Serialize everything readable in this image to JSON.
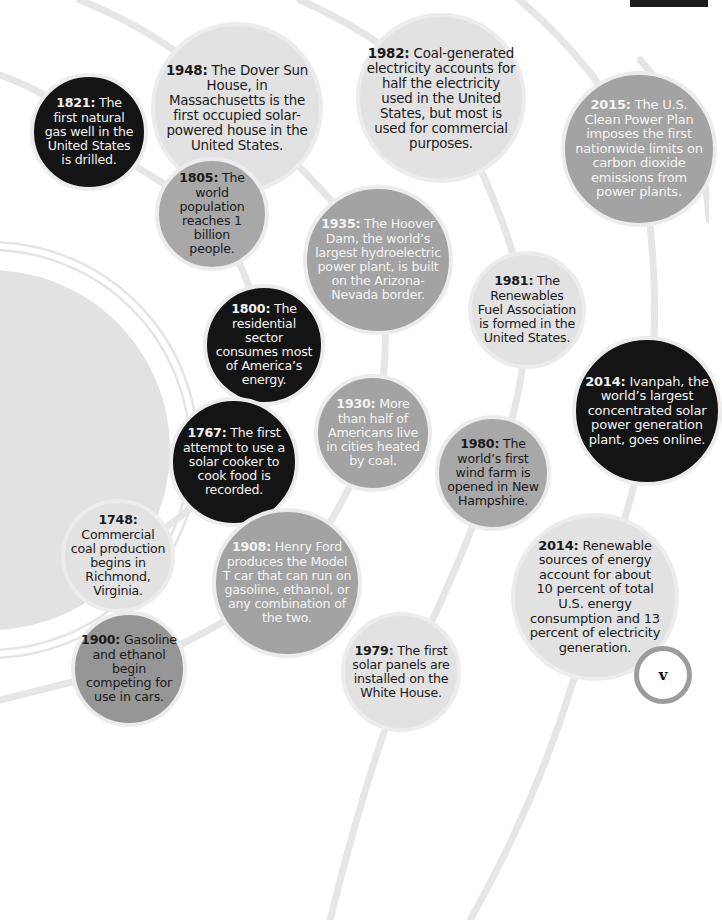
{
  "page": {
    "type": "energy history timeline infographic",
    "page_number": "v"
  },
  "colors": {
    "light_circle": "#e2e2e2",
    "mid_circle": "#a3a3a3",
    "black_circle": "#141414",
    "arc_line": "#e6e6e6",
    "badge_ring": "#9c9c9c"
  },
  "events": [
    {
      "id": "e1948",
      "year": "1948:",
      "text": " The Dover Sun House, in Massachusetts is the first occupied solar-powered house in the United States."
    },
    {
      "id": "e1982",
      "year": "1982:",
      "text": " Coal-generated electricity accounts for half the electricity used in the United States, but most is used for commercial purposes."
    },
    {
      "id": "e2015",
      "year": "2015:",
      "text": " The U.S. Clean Power Plan imposes the first nationwide limits on carbon dioxide emissions from power plants."
    },
    {
      "id": "e1821",
      "year": "1821:",
      "text": " The first natural gas well in the United States is drilled."
    },
    {
      "id": "e1805",
      "year": "1805:",
      "text": " The world population reaches 1 billion people."
    },
    {
      "id": "e1935",
      "year": "1935:",
      "text": " The Hoover Dam, the world’s largest hydroelectric power plant, is built on the Arizona-Nevada border."
    },
    {
      "id": "e1981",
      "year": "1981:",
      "text": " The Renewables Fuel Association is formed in the United States."
    },
    {
      "id": "e1800",
      "year": "1800:",
      "text": " The residential sector consumes most of America’s energy."
    },
    {
      "id": "e2014a",
      "year": "2014:",
      "text": " Ivanpah, the world’s largest concentrated solar power generation plant, goes online."
    },
    {
      "id": "e1930",
      "year": "1930:",
      "text": " More than half of Americans live in cities heated by coal."
    },
    {
      "id": "e1767",
      "year": "1767:",
      "text": " The first attempt to use a solar cooker to cook food is recorded."
    },
    {
      "id": "e1980",
      "year": "1980:",
      "text": " The world’s first wind farm is opened in New Hampshire."
    },
    {
      "id": "e1748",
      "year": "1748:",
      "text": " Commercial coal production begins in Richmond, Virginia."
    },
    {
      "id": "e1908",
      "year": "1908:",
      "text": " Henry Ford produces the Model T car that can run on gasoline, ethanol, or any combination of the two."
    },
    {
      "id": "e2014b",
      "year": "2014:",
      "text": " Renewable sources of energy account for about 10 percent of total U.S. energy consumption and 13 percent of electricity generation."
    },
    {
      "id": "e1979",
      "year": "1979:",
      "text": " The first solar panels are installed on the White House."
    },
    {
      "id": "e1900",
      "year": "1900:",
      "text": " Gasoline and ethanol begin competing for use in cars."
    }
  ]
}
